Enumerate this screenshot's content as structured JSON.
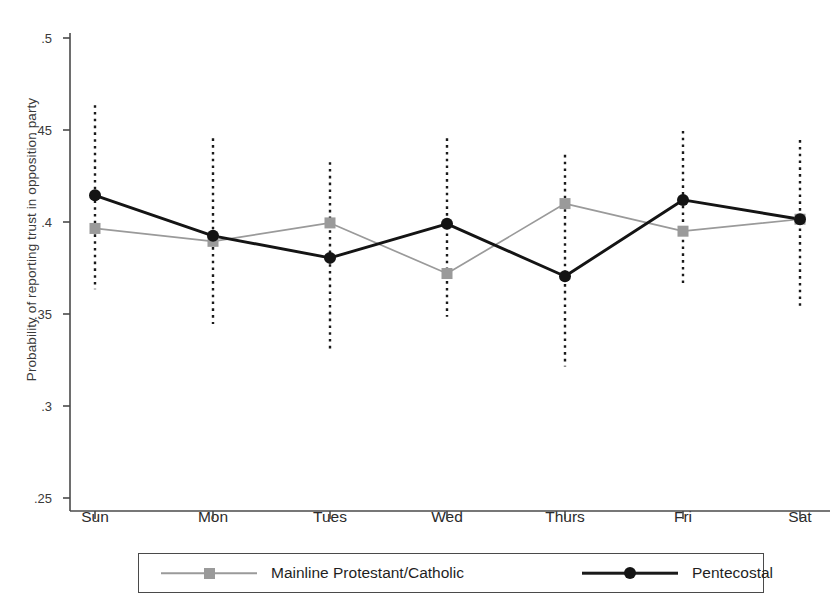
{
  "chart_data": {
    "type": "line",
    "title": "",
    "xlabel": "",
    "ylabel": "Probability of reporting trust in opposition party",
    "categories": [
      "Sun",
      "Mon",
      "Tues",
      "Wed",
      "Thurs",
      "Fri",
      "Sat"
    ],
    "ylim": [
      0.25,
      0.5
    ],
    "yticks": [
      0.5,
      0.45,
      0.4,
      0.35,
      0.3,
      0.25
    ],
    "ytick_labels": [
      ".5",
      ".45",
      ".4",
      ".35",
      ".3",
      ".25"
    ],
    "grid": false,
    "legend_position": "below-axes",
    "error_bars": "dotted vertical confidence intervals",
    "series": [
      {
        "name": "Mainline Protestant/Catholic",
        "color": "#9a9a9a",
        "marker": "square",
        "values": [
          0.3965,
          0.3895,
          0.3995,
          0.372,
          0.41,
          0.395,
          0.4015
        ],
        "ci_low": [
          0.3635,
          0.3445,
          0.3305,
          0.3485,
          0.3215,
          0.3645,
          0.3545
        ],
        "ci_high": [
          0.4635,
          0.4455,
          0.4325,
          0.4455,
          0.4365,
          0.4495,
          0.4445
        ]
      },
      {
        "name": "Pentecostal",
        "color": "#141414",
        "marker": "circle",
        "values": [
          0.4145,
          0.3925,
          0.3805,
          0.399,
          0.3705,
          0.412,
          0.4015
        ],
        "ci_low": [
          0.3635,
          0.3445,
          0.3305,
          0.3485,
          0.3215,
          0.3645,
          0.3545
        ],
        "ci_high": [
          0.4635,
          0.4455,
          0.4325,
          0.4455,
          0.4365,
          0.4495,
          0.4445
        ]
      }
    ]
  },
  "legend": {
    "entries": [
      {
        "label": "Mainline Protestant/Catholic"
      },
      {
        "label": "Pentecostal"
      }
    ]
  }
}
